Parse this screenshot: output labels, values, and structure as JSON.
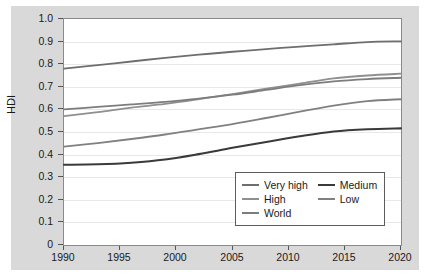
{
  "chart_data": {
    "type": "line",
    "title": "",
    "xlabel": "",
    "ylabel": "HDI",
    "xlim": [
      1990,
      2020
    ],
    "ylim": [
      0,
      1.0
    ],
    "grid": true,
    "legend_position": "bottom-right",
    "x": [
      1990,
      1995,
      2000,
      2005,
      2010,
      2015,
      2020
    ],
    "ytick_labels": [
      "1.0",
      "0.9",
      "0.8",
      "0.7",
      "0.6",
      "0.5",
      "0.4",
      "0.3",
      "0.2",
      "0.1",
      "0"
    ],
    "ytick_values": [
      1.0,
      0.9,
      0.8,
      0.7,
      0.6,
      0.5,
      0.4,
      0.3,
      0.2,
      0.1,
      0
    ],
    "xtick_labels": [
      "1990",
      "1995",
      "2000",
      "2005",
      "2010",
      "2015",
      "2020"
    ],
    "xtick_values": [
      1990,
      1995,
      2000,
      2005,
      2010,
      2015,
      2020
    ],
    "series": [
      {
        "name": "Very high",
        "color": "#6e6e6e",
        "width": 1.8,
        "values": [
          0.78,
          0.806,
          0.832,
          0.855,
          0.875,
          0.894,
          0.901
        ],
        "points": [
          [
            1990,
            0.78
          ],
          [
            1993,
            0.796
          ],
          [
            1996,
            0.812
          ],
          [
            1999,
            0.828
          ],
          [
            2002,
            0.842
          ],
          [
            2005,
            0.855
          ],
          [
            2008,
            0.867
          ],
          [
            2011,
            0.878
          ],
          [
            2014,
            0.888
          ],
          [
            2017,
            0.898
          ],
          [
            2020,
            0.901
          ]
        ]
      },
      {
        "name": "High",
        "color": "#8f8f8f",
        "width": 1.8,
        "values": [
          0.57,
          0.6,
          0.63,
          0.668,
          0.706,
          0.745,
          0.758
        ],
        "points": [
          [
            1990,
            0.57
          ],
          [
            1993,
            0.588
          ],
          [
            1996,
            0.608
          ],
          [
            1999,
            0.624
          ],
          [
            2002,
            0.645
          ],
          [
            2005,
            0.668
          ],
          [
            2008,
            0.692
          ],
          [
            2011,
            0.714
          ],
          [
            2014,
            0.737
          ],
          [
            2017,
            0.75
          ],
          [
            2020,
            0.758
          ]
        ]
      },
      {
        "name": "World",
        "color": "#7d7d7d",
        "width": 1.8,
        "values": [
          0.6,
          0.618,
          0.637,
          0.665,
          0.7,
          0.73,
          0.74
        ],
        "points": [
          [
            1990,
            0.6
          ],
          [
            1993,
            0.611
          ],
          [
            1996,
            0.622
          ],
          [
            1999,
            0.633
          ],
          [
            2002,
            0.648
          ],
          [
            2005,
            0.665
          ],
          [
            2008,
            0.686
          ],
          [
            2011,
            0.707
          ],
          [
            2014,
            0.724
          ],
          [
            2017,
            0.734
          ],
          [
            2020,
            0.74
          ]
        ]
      },
      {
        "name": "Low",
        "color": "#808080",
        "width": 1.8,
        "values": [
          0.435,
          0.462,
          0.492,
          0.535,
          0.583,
          0.627,
          0.645
        ],
        "points": [
          [
            1990,
            0.435
          ],
          [
            1993,
            0.451
          ],
          [
            1996,
            0.469
          ],
          [
            1999,
            0.489
          ],
          [
            2002,
            0.512
          ],
          [
            2005,
            0.535
          ],
          [
            2008,
            0.562
          ],
          [
            2011,
            0.59
          ],
          [
            2014,
            0.617
          ],
          [
            2017,
            0.637
          ],
          [
            2020,
            0.645
          ]
        ]
      },
      {
        "name": "Medium",
        "color": "#3a3a3a",
        "width": 2.1,
        "values": [
          0.355,
          0.362,
          0.383,
          0.43,
          0.477,
          0.51,
          0.516
        ],
        "points": [
          [
            1990,
            0.355
          ],
          [
            1993,
            0.357
          ],
          [
            1996,
            0.364
          ],
          [
            1999,
            0.378
          ],
          [
            2002,
            0.402
          ],
          [
            2005,
            0.43
          ],
          [
            2008,
            0.456
          ],
          [
            2011,
            0.481
          ],
          [
            2014,
            0.502
          ],
          [
            2017,
            0.512
          ],
          [
            2020,
            0.516
          ]
        ]
      }
    ],
    "legend_entries": [
      {
        "label": "Very high",
        "color": "#6e6e6e",
        "column": 0,
        "row": 0
      },
      {
        "label": "Medium",
        "color": "#3a3a3a",
        "column": 1,
        "row": 0
      },
      {
        "label": "High",
        "color": "#8f8f8f",
        "column": 0,
        "row": 1
      },
      {
        "label": "Low",
        "color": "#808080",
        "column": 1,
        "row": 1
      },
      {
        "label": "World",
        "color": "#7d7d7d",
        "column": 0,
        "row": 2
      }
    ]
  },
  "figure": {
    "background": "#d9d9d9",
    "plot_background": "#ffffff",
    "border_color": "#8a8a8a",
    "grid_color": "#e8e8e8"
  }
}
